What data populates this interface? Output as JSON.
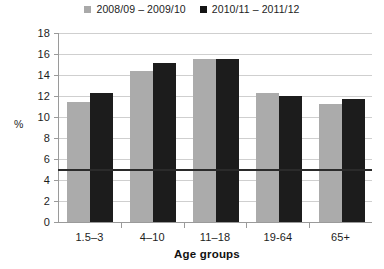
{
  "chart_data": {
    "type": "bar",
    "title": "",
    "xlabel": "Age groups",
    "ylabel": "%",
    "categories": [
      "1.5–3",
      "4–10",
      "11–18",
      "19-64",
      "65+"
    ],
    "series": [
      {
        "name": "2008/09 – 2009/10",
        "color": "#ababab",
        "values": [
          11.4,
          14.4,
          15.5,
          12.3,
          11.2
        ]
      },
      {
        "name": "2010/11 – 2011/12",
        "color": "#1c1c1c",
        "values": [
          12.3,
          15.1,
          15.5,
          12.0,
          11.7
        ]
      }
    ],
    "ylim": [
      0,
      18
    ],
    "yticks": [
      0,
      2,
      4,
      6,
      8,
      10,
      12,
      14,
      16,
      18
    ],
    "ytick_labels": [
      "0",
      "2",
      "4",
      "6",
      "8",
      "10",
      "12",
      "14",
      "16",
      "18"
    ],
    "grid": true,
    "legend_position": "top-center",
    "reference_line": {
      "value": 5,
      "color": "#2b2b2b"
    }
  },
  "legend": {
    "items": [
      {
        "label": "2008/09 – 2009/10",
        "swatch": "legend-swatch-gray"
      },
      {
        "label": "2010/11 – 2011/12",
        "swatch": "legend-swatch-black"
      }
    ]
  },
  "axes": {
    "y_title": "%",
    "x_title": "Age groups"
  }
}
